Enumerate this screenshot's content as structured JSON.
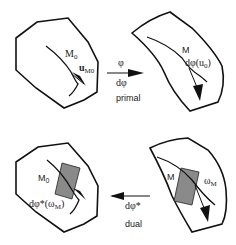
{
  "diagram": {
    "panels": {
      "top_left": {
        "point_label": "M",
        "point_sub": "0",
        "vector_label": "u",
        "vector_sub": "M0"
      },
      "top_right": {
        "point_label": "M",
        "vector_label": "dφ(u",
        "vector_sub": "0",
        "vector_close": ")"
      },
      "bottom_left": {
        "point_label": "M",
        "point_sub": "0",
        "form_label": "dφ*(ω",
        "form_sub": "M",
        "form_close": ")"
      },
      "bottom_right": {
        "point_label": "M",
        "form_label": "ω",
        "form_sub": "M"
      }
    },
    "arrows": {
      "primal": {
        "top_label": "φ",
        "bottom_label": "dφ",
        "caption": "primal",
        "direction": "right"
      },
      "dual": {
        "label": "dφ*",
        "caption": "dual",
        "direction": "left"
      }
    },
    "colors": {
      "stroke": "#111111",
      "patch": "#8a8a8a"
    }
  }
}
